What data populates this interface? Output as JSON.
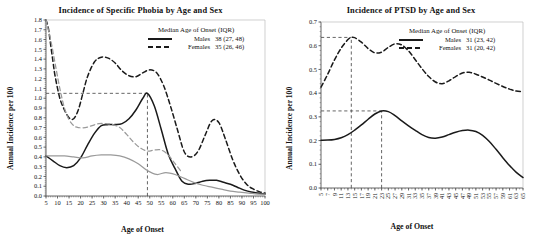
{
  "figure": {
    "caption": "Two-panel line chart of annual incidence per 100 by age of onset and sex"
  },
  "panels": [
    {
      "id": "specific-phobia",
      "title": "Incidence of Specific Phobia by Age and Sex",
      "ylabel": "Annual Incidence per 100",
      "xlabel": "Age of Onset",
      "legend": {
        "title": "Median Age of Onset (IQR)",
        "rows": [
          {
            "key": "solid",
            "sex": "Males",
            "value": "38 (27, 48)"
          },
          {
            "key": "dashed",
            "sex": "Females",
            "value": "35 (26, 46)"
          }
        ]
      },
      "chart_data": {
        "type": "line",
        "title": "Incidence of Specific Phobia by Age and Sex",
        "xlabel": "Age of Onset",
        "ylabel": "Annual Incidence per 100",
        "xlim": [
          5,
          100
        ],
        "ylim": [
          0.0,
          1.8
        ],
        "xticks": [
          5,
          10,
          15,
          20,
          25,
          30,
          35,
          40,
          45,
          50,
          55,
          60,
          65,
          70,
          75,
          80,
          85,
          90,
          95,
          100
        ],
        "yticks": [
          0.0,
          0.1,
          0.2,
          0.3,
          0.4,
          0.5,
          0.6,
          0.7,
          0.8,
          0.9,
          1.0,
          1.1,
          1.2,
          1.3,
          1.4,
          1.5,
          1.6,
          1.7,
          1.8
        ],
        "grid": false,
        "legend_position": "top-right",
        "annotations": [
          {
            "type": "reference-line",
            "orientation": "vertical",
            "x": 49,
            "label": "male median peak"
          },
          {
            "type": "reference-line",
            "orientation": "horizontal",
            "y": 1.05,
            "label": "male peak incidence"
          }
        ],
        "series": [
          {
            "name": "Males",
            "style": "solid",
            "color": "#1a1a1a",
            "x": [
              5,
              8,
              11,
              14,
              17,
              20,
              23,
              26,
              29,
              32,
              35,
              38,
              41,
              44,
              47,
              49,
              52,
              55,
              58,
              61,
              64,
              67,
              70,
              73,
              76,
              79,
              82,
              85,
              88,
              91,
              94,
              97,
              100
            ],
            "y": [
              0.41,
              0.36,
              0.31,
              0.29,
              0.31,
              0.39,
              0.52,
              0.64,
              0.72,
              0.73,
              0.73,
              0.74,
              0.79,
              0.88,
              1.0,
              1.05,
              0.92,
              0.68,
              0.43,
              0.28,
              0.15,
              0.12,
              0.13,
              0.15,
              0.16,
              0.16,
              0.14,
              0.12,
              0.09,
              0.06,
              0.04,
              0.03,
              0.02
            ]
          },
          {
            "name": "Females",
            "style": "dashed",
            "color": "#1a1a1a",
            "x": [
              5,
              6,
              7,
              8,
              9,
              11,
              13,
              15,
              17,
              19,
              21,
              23,
              26,
              29,
              32,
              35,
              38,
              41,
              44,
              47,
              50,
              53,
              56,
              59,
              62,
              65,
              68,
              71,
              74,
              77,
              80,
              83,
              86,
              89,
              92,
              95,
              98,
              100
            ],
            "y": [
              1.8,
              1.72,
              1.55,
              1.38,
              1.22,
              1.0,
              0.88,
              0.8,
              0.79,
              0.88,
              1.05,
              1.22,
              1.37,
              1.42,
              1.41,
              1.36,
              1.28,
              1.23,
              1.22,
              1.26,
              1.29,
              1.26,
              1.13,
              0.92,
              0.68,
              0.45,
              0.4,
              0.46,
              0.62,
              0.77,
              0.75,
              0.57,
              0.37,
              0.22,
              0.12,
              0.07,
              0.04,
              0.03
            ]
          },
          {
            "name": "Males (reference, grey)",
            "style": "solid",
            "color": "#9a9a9a",
            "x": [
              5,
              9,
              13,
              17,
              21,
              25,
              29,
              33,
              37,
              41,
              45,
              49,
              53,
              57,
              61,
              65,
              69,
              73,
              77,
              81,
              85,
              89,
              93,
              97,
              100
            ],
            "y": [
              0.41,
              0.41,
              0.41,
              0.4,
              0.39,
              0.41,
              0.42,
              0.42,
              0.41,
              0.38,
              0.33,
              0.26,
              0.22,
              0.24,
              0.22,
              0.18,
              0.14,
              0.11,
              0.09,
              0.07,
              0.05,
              0.04,
              0.03,
              0.02,
              0.02
            ]
          },
          {
            "name": "Females (reference, grey)",
            "style": "dashed",
            "color": "#9a9a9a",
            "x": [
              5,
              7,
              9,
              11,
              13,
              15,
              17,
              19,
              22,
              25,
              28,
              31,
              34,
              37,
              40,
              43,
              46,
              49,
              52,
              55,
              58,
              61,
              64
            ],
            "y": [
              1.8,
              1.6,
              1.35,
              1.1,
              0.9,
              0.78,
              0.72,
              0.7,
              0.7,
              0.72,
              0.74,
              0.74,
              0.73,
              0.7,
              0.63,
              0.55,
              0.49,
              0.46,
              0.47,
              0.47,
              0.42,
              0.33,
              0.24
            ]
          }
        ]
      }
    },
    {
      "id": "ptsd",
      "title": "Incidence of PTSD by Age and Sex",
      "ylabel": "Annual Incidence per 100",
      "xlabel": "Age of Onset",
      "legend": {
        "title": "Median Age of Onset (IQR)",
        "rows": [
          {
            "key": "solid",
            "sex": "Males",
            "value": "31 (23, 42)"
          },
          {
            "key": "dashed",
            "sex": "Females",
            "value": "31 (20, 42)"
          }
        ]
      },
      "chart_data": {
        "type": "line",
        "title": "Incidence of PTSD by Age and Sex",
        "xlabel": "Age of Onset",
        "ylabel": "Annual Incidence per 100",
        "xlim": [
          5,
          65
        ],
        "ylim": [
          0.0,
          0.7
        ],
        "xticks": [
          5,
          7,
          9,
          11,
          13,
          15,
          17,
          19,
          21,
          23,
          25,
          27,
          29,
          31,
          33,
          35,
          37,
          39,
          41,
          43,
          45,
          47,
          49,
          51,
          53,
          55,
          57,
          59,
          61,
          63,
          65
        ],
        "yticks": [
          0.0,
          0.1,
          0.2,
          0.3,
          0.4,
          0.5,
          0.6,
          0.7
        ],
        "grid": false,
        "legend_position": "top-right",
        "annotations": [
          {
            "type": "reference-line",
            "orientation": "vertical",
            "x": 14,
            "label": "female peak"
          },
          {
            "type": "reference-line",
            "orientation": "horizontal",
            "y": 0.635,
            "label": "female peak incidence"
          },
          {
            "type": "reference-line",
            "orientation": "vertical",
            "x": 23,
            "label": "male peak"
          },
          {
            "type": "reference-line",
            "orientation": "horizontal",
            "y": 0.325,
            "label": "male peak incidence"
          }
        ],
        "series": [
          {
            "name": "Males",
            "style": "solid",
            "color": "#1a1a1a",
            "x": [
              5,
              7,
              9,
              11,
              13,
              15,
              17,
              19,
              21,
              23,
              25,
              27,
              29,
              31,
              33,
              35,
              37,
              39,
              41,
              43,
              45,
              47,
              49,
              51,
              53,
              55,
              57,
              59,
              61,
              63,
              65
            ],
            "y": [
              0.201,
              0.202,
              0.205,
              0.212,
              0.225,
              0.244,
              0.266,
              0.29,
              0.312,
              0.325,
              0.322,
              0.305,
              0.283,
              0.262,
              0.243,
              0.225,
              0.213,
              0.21,
              0.215,
              0.225,
              0.235,
              0.242,
              0.244,
              0.238,
              0.222,
              0.196,
              0.163,
              0.128,
              0.095,
              0.066,
              0.044
            ]
          },
          {
            "name": "Females",
            "style": "dashed",
            "color": "#1a1a1a",
            "x": [
              5,
              7,
              9,
              11,
              13,
              14,
              15,
              17,
              19,
              21,
              23,
              25,
              27,
              29,
              31,
              33,
              35,
              37,
              39,
              41,
              43,
              45,
              47,
              49,
              51,
              53,
              55,
              57,
              59,
              61,
              63,
              65
            ],
            "y": [
              0.425,
              0.48,
              0.54,
              0.59,
              0.626,
              0.635,
              0.634,
              0.615,
              0.588,
              0.57,
              0.573,
              0.593,
              0.608,
              0.603,
              0.578,
              0.541,
              0.503,
              0.47,
              0.447,
              0.44,
              0.452,
              0.47,
              0.485,
              0.488,
              0.48,
              0.468,
              0.455,
              0.441,
              0.428,
              0.417,
              0.409,
              0.406
            ]
          }
        ]
      }
    }
  ]
}
